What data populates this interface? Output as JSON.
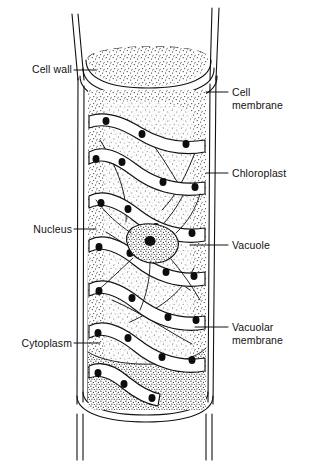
{
  "figure": {
    "style": "black-and-white line drawing with stipple shading",
    "width": 314,
    "height": 466,
    "background_color": "#ffffff",
    "ink_color": "#121212"
  },
  "labels": [
    {
      "id": "cell-wall",
      "text": "Cell wall",
      "side": "left",
      "text_x": 18,
      "text_y": 63,
      "leader": {
        "x1": 74,
        "y1": 70,
        "x2": 96,
        "y2": 70
      }
    },
    {
      "id": "cell-membrane",
      "text_line1": "Cell",
      "text_line2": "membrane",
      "text": "Cell membrane",
      "side": "right",
      "text_x": 232,
      "text_y": 86,
      "leader": {
        "x1": 206,
        "y1": 92,
        "x2": 228,
        "y2": 92
      }
    },
    {
      "id": "chloroplast",
      "text": "Chloroplast",
      "side": "right",
      "text_x": 232,
      "text_y": 167,
      "leader": {
        "x1": 206,
        "y1": 173,
        "x2": 228,
        "y2": 173
      }
    },
    {
      "id": "nucleus",
      "text": "Nucleus",
      "side": "left",
      "text_x": 18,
      "text_y": 223,
      "leader": {
        "x1": 74,
        "y1": 229,
        "x2": 96,
        "y2": 229
      }
    },
    {
      "id": "vacuole",
      "text": "Vacuole",
      "side": "right",
      "text_x": 232,
      "text_y": 239,
      "leader": {
        "x1": 190,
        "y1": 245,
        "x2": 228,
        "y2": 245
      }
    },
    {
      "id": "vacuolar-membrane",
      "text_line1": "Vacuolar",
      "text_line2": "membrane",
      "text": "Vacuolar membrane",
      "side": "right",
      "text_x": 232,
      "text_y": 321,
      "leader": {
        "x1": 195,
        "y1": 327,
        "x2": 228,
        "y2": 327
      }
    },
    {
      "id": "cytoplasm",
      "text": "Cytoplasm",
      "side": "left",
      "text_x": 8,
      "text_y": 337,
      "leader": {
        "x1": 74,
        "y1": 343,
        "x2": 100,
        "y2": 343
      }
    }
  ],
  "structures": {
    "cell_wall": {
      "name": "cell-wall",
      "description": "double-lined cylindrical wall of the filament"
    },
    "cell_membrane": {
      "name": "cell-membrane",
      "description": "inner line just inside the cell wall"
    },
    "chloroplast": {
      "name": "chloroplast",
      "description": "helical ribbon band spiralling around the cell periphery",
      "band_count": 7,
      "pyrenoid_count": 26
    },
    "nucleus": {
      "name": "nucleus",
      "description": "central nucleus suspended by cytoplasmic strands"
    },
    "vacuole": {
      "name": "vacuole",
      "description": "large central stippled space filling the cell interior"
    },
    "vacuolar_membrane": {
      "name": "vacuolar-membrane",
      "description": "tonoplast line bounding the central vacuole"
    },
    "cytoplasm": {
      "name": "cytoplasm",
      "description": "stippled peripheral layer lining the cell membrane"
    }
  }
}
